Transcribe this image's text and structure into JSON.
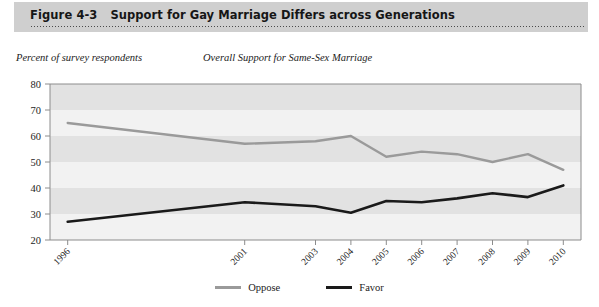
{
  "figure": {
    "number": "Figure 4-3",
    "title": "Support for Gay Marriage Differs across Generations"
  },
  "captions": {
    "y_axis": "Percent of survey respondents",
    "plot_title": "Overall Support for Same-Sex Marriage"
  },
  "legend": {
    "items": [
      {
        "label": "Oppose",
        "color": "#9a9a9a"
      },
      {
        "label": "Favor",
        "color": "#1a1a1a"
      }
    ]
  },
  "colors": {
    "header_band": "#cfcfcf",
    "plot_band_light": "#f2f2f2",
    "plot_band_dark": "#e2e2e2",
    "oppose": "#9a9a9a",
    "favor": "#1a1a1a",
    "axis": "#8c8c8c"
  },
  "chart_data": {
    "type": "line",
    "title": "Overall Support for Same-Sex Marriage",
    "xlabel": "",
    "ylabel": "Percent of survey respondents",
    "categories": [
      "1996",
      "2001",
      "2003",
      "2004",
      "2005",
      "2006",
      "2007",
      "2008",
      "2009",
      "2010"
    ],
    "x": [
      1996,
      2001,
      2003,
      2004,
      2005,
      2006,
      2007,
      2008,
      2009,
      2010
    ],
    "xlim": [
      1995.5,
      2010.5
    ],
    "ylim": [
      20,
      80
    ],
    "yticks": [
      20,
      30,
      40,
      50,
      60,
      70,
      80
    ],
    "ytick_labels": [
      "20",
      "30",
      "40",
      "50",
      "60",
      "70",
      "80"
    ],
    "grid": false,
    "banded_background": true,
    "legend_position": "bottom-center",
    "series": [
      {
        "name": "Oppose",
        "color": "#9a9a9a",
        "values": [
          65,
          57,
          58,
          60,
          52,
          54,
          53,
          50,
          53,
          47
        ]
      },
      {
        "name": "Favor",
        "color": "#1a1a1a",
        "values": [
          27,
          34.5,
          33,
          30.5,
          35,
          34.5,
          36,
          38,
          36.5,
          41
        ]
      }
    ]
  }
}
